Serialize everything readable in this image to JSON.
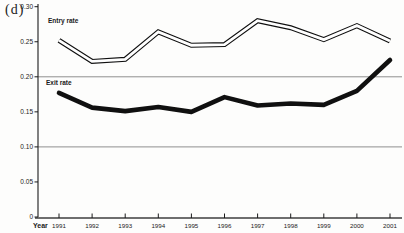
{
  "panel_label": "(d)",
  "colors": {
    "background": "#fdfdfc",
    "axis": "#1a1a1a",
    "x_axis_line": "#6e6e6e",
    "grid": "#8f8f8f",
    "text": "#1a1a1a",
    "line": "#101010",
    "entry_core": "#ffffff"
  },
  "chart_data": {
    "type": "line",
    "title": "",
    "xlabel": "Year",
    "ylabel": "",
    "x": [
      1991,
      1992,
      1993,
      1994,
      1995,
      1996,
      1997,
      1998,
      1999,
      2000,
      2001
    ],
    "x_tick_labels": [
      "1991",
      "1992",
      "1993",
      "1994",
      "1995",
      "1996",
      "1997",
      "1998",
      "1999",
      "2000",
      "2001"
    ],
    "y_tick_labels": [
      "0.30",
      "0.25",
      "0.20",
      "0.15",
      "0.10",
      "0.05",
      "0"
    ],
    "y_tick_values": [
      0.3,
      0.25,
      0.2,
      0.15,
      0.1,
      0.05,
      0
    ],
    "ylim": [
      0,
      0.3
    ],
    "grid": "horizontal-reference-lines",
    "gridline_values": [
      0.2,
      0.1
    ],
    "legend_position": "inline-labels",
    "series": [
      {
        "name": "Entry rate",
        "style": "hollow-double-line",
        "color": "#101010",
        "values": [
          0.252,
          0.222,
          0.225,
          0.264,
          0.245,
          0.246,
          0.28,
          0.27,
          0.253,
          0.273,
          0.251
        ],
        "label_offset": [
          -11,
          -17
        ]
      },
      {
        "name": "Exit rate",
        "style": "thick-solid-line",
        "color": "#101010",
        "values": [
          0.177,
          0.156,
          0.151,
          0.157,
          0.15,
          0.171,
          0.159,
          0.162,
          0.16,
          0.18,
          0.224
        ],
        "label_offset": [
          -13,
          -8
        ]
      }
    ]
  }
}
